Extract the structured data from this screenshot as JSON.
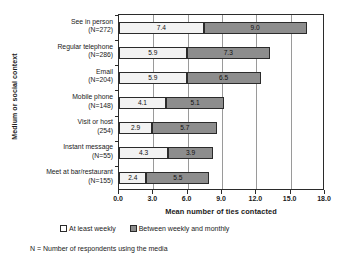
{
  "chart_data": {
    "type": "bar",
    "orientation": "horizontal",
    "stacked": true,
    "title": "",
    "xlabel": "Mean number of ties contacted",
    "ylabel": "Medium or social context",
    "xlim": [
      0,
      18
    ],
    "grid": true,
    "legend_position": "bottom",
    "xticks": [
      "0.0",
      "3.0",
      "6.0",
      "9.0",
      "12.0",
      "15.0",
      "18.0"
    ],
    "xtick_values": [
      0,
      3,
      6,
      9,
      12,
      15,
      18
    ],
    "categories": [
      "See in person",
      "Regular telephone",
      "Email",
      "Mobile phone",
      "Visit or host",
      "Instant message",
      "Meet at bar/restaurant"
    ],
    "category_counts": [
      "(N=272)",
      "(N=286)",
      "(N=204)",
      "(N=148)",
      "(254)",
      "(N=55)",
      "(N=155)"
    ],
    "series": [
      {
        "name": "At least weekly",
        "color": "#f2f2f2",
        "values": [
          7.4,
          5.9,
          5.9,
          4.1,
          2.9,
          4.3,
          2.4
        ],
        "labels": [
          "7.4",
          "5.9",
          "5.9",
          "4.1",
          "2.9",
          "4.3",
          "2.4"
        ]
      },
      {
        "name": "Between weekly and monthly",
        "color": "#8d8d8d",
        "values": [
          9.0,
          7.3,
          6.5,
          5.1,
          5.7,
          3.9,
          5.5
        ],
        "labels": [
          "9.0",
          "7.3",
          "6.5",
          "5.1",
          "5.7",
          "3.9",
          "5.5"
        ]
      }
    ],
    "totals": [
      16.4,
      13.2,
      12.4,
      9.2,
      8.6,
      8.2,
      7.9
    ],
    "footnote": "N = Number of respondents using the media"
  }
}
